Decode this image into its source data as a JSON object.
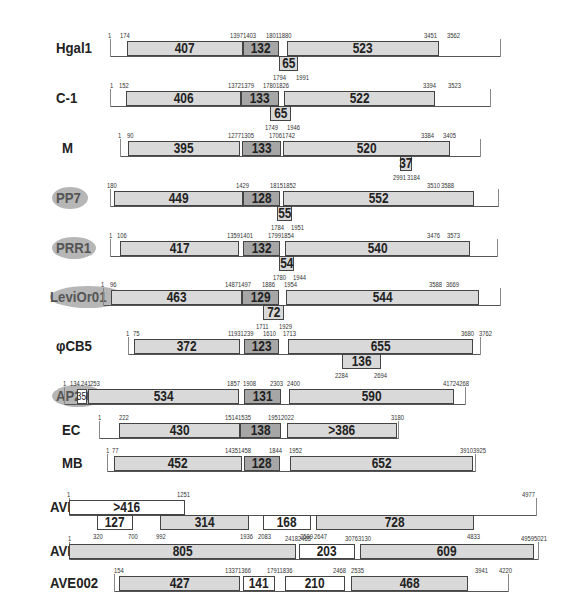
{
  "diagram": {
    "type": "genome-organization",
    "rows": [
      {
        "name": "Hgal1",
        "oval": false,
        "y": 48,
        "baseline": [
          110,
          500
        ],
        "coords_top": [
          {
            "t": "1",
            "x": 108
          },
          {
            "t": "174",
            "x": 120
          },
          {
            "t": "13971403",
            "x": 230
          },
          {
            "t": "18011880",
            "x": 266
          },
          {
            "t": "3451",
            "x": 424
          },
          {
            "t": "3562",
            "x": 447
          }
        ],
        "boxes": [
          {
            "v": "407",
            "x": 127,
            "w": 116,
            "cls": "light"
          },
          {
            "v": "132",
            "x": 243,
            "w": 36,
            "cls": "dark"
          },
          {
            "v": "523",
            "x": 287,
            "w": 152,
            "cls": "light"
          }
        ],
        "lower": [
          {
            "v": "65",
            "x": 279,
            "w": 19,
            "cls": "light"
          }
        ],
        "coords_bottom": [
          {
            "t": "1794",
            "x": 273
          },
          {
            "t": "1991",
            "x": 296
          }
        ]
      },
      {
        "name": "C-1",
        "oval": false,
        "y": 98,
        "baseline": [
          110,
          490
        ],
        "coords_top": [
          {
            "t": "1",
            "x": 110
          },
          {
            "t": "152",
            "x": 119
          },
          {
            "t": "13721379",
            "x": 228
          },
          {
            "t": "17801826",
            "x": 263
          },
          {
            "t": "3394",
            "x": 423
          },
          {
            "t": "3523",
            "x": 448
          }
        ],
        "boxes": [
          {
            "v": "406",
            "x": 126,
            "w": 115,
            "cls": "light"
          },
          {
            "v": "133",
            "x": 241,
            "w": 38,
            "cls": "dark"
          },
          {
            "v": "522",
            "x": 284,
            "w": 151,
            "cls": "light"
          }
        ],
        "lower": [
          {
            "v": "65",
            "x": 270,
            "w": 21,
            "cls": "light"
          }
        ],
        "coords_bottom": [
          {
            "t": "1749",
            "x": 265
          },
          {
            "t": "1946",
            "x": 287
          }
        ]
      },
      {
        "name": "M",
        "oval": false,
        "y": 148,
        "baseline": [
          120,
          480
        ],
        "coords_top": [
          {
            "t": "1",
            "x": 118
          },
          {
            "t": "90",
            "x": 127
          },
          {
            "t": "12771305",
            "x": 228
          },
          {
            "t": "17061742",
            "x": 269
          },
          {
            "t": "3384",
            "x": 421
          },
          {
            "t": "3405",
            "x": 443
          }
        ],
        "boxes": [
          {
            "v": "395",
            "x": 128,
            "w": 112,
            "cls": "light"
          },
          {
            "v": "133",
            "x": 242,
            "w": 39,
            "cls": "dark"
          },
          {
            "v": "520",
            "x": 283,
            "w": 167,
            "cls": "light"
          }
        ],
        "lower": [
          {
            "v": "37",
            "x": 400,
            "w": 12,
            "cls": "light"
          }
        ],
        "coords_bottom": [
          {
            "t": "2991",
            "x": 393
          },
          {
            "t": "3184",
            "x": 407
          }
        ]
      },
      {
        "name": "PP7",
        "oval": true,
        "y": 198,
        "baseline": [
          110,
          498
        ],
        "coords_top": [
          {
            "t": "180",
            "x": 107
          },
          {
            "t": "1429",
            "x": 236
          },
          {
            "t": "18151852",
            "x": 270
          },
          {
            "t": "3510",
            "x": 427
          },
          {
            "t": "3588",
            "x": 441
          }
        ],
        "boxes": [
          {
            "v": "449",
            "x": 114,
            "w": 129,
            "cls": "light"
          },
          {
            "v": "128",
            "x": 243,
            "w": 37,
            "cls": "dark"
          },
          {
            "v": "552",
            "x": 283,
            "w": 191,
            "cls": "light"
          }
        ],
        "lower": [
          {
            "v": "55",
            "x": 277,
            "w": 15,
            "cls": "light"
          }
        ],
        "coords_bottom": [
          {
            "t": "1784",
            "x": 271
          },
          {
            "t": "1951",
            "x": 291
          }
        ]
      },
      {
        "name": "PRR1",
        "oval": true,
        "y": 248,
        "baseline": [
          110,
          497
        ],
        "coords_top": [
          {
            "t": "1",
            "x": 109
          },
          {
            "t": "106",
            "x": 117
          },
          {
            "t": "13591401",
            "x": 227
          },
          {
            "t": "17991854",
            "x": 268
          },
          {
            "t": "3476",
            "x": 427
          },
          {
            "t": "3573",
            "x": 447
          }
        ],
        "boxes": [
          {
            "v": "417",
            "x": 120,
            "w": 119,
            "cls": "light"
          },
          {
            "v": "132",
            "x": 243,
            "w": 37,
            "cls": "dark"
          },
          {
            "v": "540",
            "x": 285,
            "w": 185,
            "cls": "light"
          }
        ],
        "lower": [
          {
            "v": "54",
            "x": 279,
            "w": 15,
            "cls": "light"
          }
        ],
        "coords_bottom": [
          {
            "t": "1780",
            "x": 273
          },
          {
            "t": "1944",
            "x": 293
          }
        ]
      },
      {
        "name": "LeviOr01",
        "oval": true,
        "y": 297,
        "baseline": [
          103,
          500
        ],
        "coords_top": [
          {
            "t": "1",
            "x": 101
          },
          {
            "t": "96",
            "x": 110
          },
          {
            "t": "14871497",
            "x": 225
          },
          {
            "t": "1886",
            "x": 262
          },
          {
            "t": "1954",
            "x": 284
          },
          {
            "t": "3588",
            "x": 429
          },
          {
            "t": "3669",
            "x": 446
          }
        ],
        "boxes": [
          {
            "v": "463",
            "x": 111,
            "w": 131,
            "cls": "light"
          },
          {
            "v": "129",
            "x": 242,
            "w": 37,
            "cls": "dark"
          },
          {
            "v": "544",
            "x": 286,
            "w": 193,
            "cls": "light"
          }
        ],
        "lower": [
          {
            "v": "72",
            "x": 263,
            "w": 21,
            "cls": "light"
          }
        ],
        "coords_bottom": [
          {
            "t": "1711",
            "x": 256
          },
          {
            "t": "1929",
            "x": 279
          }
        ]
      },
      {
        "name": "φCB5",
        "oval": false,
        "y": 346,
        "baseline": [
          128,
          480
        ],
        "coords_top": [
          {
            "t": "1",
            "x": 126
          },
          {
            "t": "75",
            "x": 133
          },
          {
            "t": "11931239",
            "x": 228
          },
          {
            "t": "1610",
            "x": 263
          },
          {
            "t": "1713",
            "x": 283
          },
          {
            "t": "3680",
            "x": 461
          },
          {
            "t": "3762",
            "x": 479
          }
        ],
        "boxes": [
          {
            "v": "372",
            "x": 134,
            "w": 106,
            "cls": "light"
          },
          {
            "v": "123",
            "x": 244,
            "w": 35,
            "cls": "dark"
          },
          {
            "v": "655",
            "x": 288,
            "w": 185,
            "cls": "light"
          }
        ],
        "lower": [
          {
            "v": "136",
            "x": 342,
            "w": 39,
            "cls": "light"
          }
        ],
        "coords_bottom": [
          {
            "t": "2284",
            "x": 335
          },
          {
            "t": "2694",
            "x": 374
          }
        ]
      },
      {
        "name": "AP205",
        "oval": true,
        "y": 396,
        "baseline": [
          64,
          465
        ],
        "coords_top": [
          {
            "t": "1",
            "x": 63
          },
          {
            "t": "134",
            "x": 70
          },
          {
            "t": "241",
            "x": 81
          },
          {
            "t": "253",
            "x": 90
          },
          {
            "t": "1857",
            "x": 227
          },
          {
            "t": "1908",
            "x": 243
          },
          {
            "t": "2303",
            "x": 270
          },
          {
            "t": "2400",
            "x": 287
          },
          {
            "t": "4172",
            "x": 443
          },
          {
            "t": "4268",
            "x": 456
          }
        ],
        "boxes": [
          {
            "v": "35",
            "x": 77,
            "w": 10,
            "cls": "white small"
          },
          {
            "v": "534",
            "x": 88,
            "w": 151,
            "cls": "light"
          },
          {
            "v": "131",
            "x": 244,
            "w": 37,
            "cls": "dark"
          },
          {
            "v": "590",
            "x": 289,
            "w": 165,
            "cls": "light"
          }
        ],
        "lower": [],
        "coords_bottom": []
      },
      {
        "name": "EC",
        "oval": false,
        "y": 430,
        "baseline": [
          99,
          398
        ],
        "coords_top": [
          {
            "t": "1",
            "x": 98
          },
          {
            "t": "222",
            "x": 119
          },
          {
            "t": "15141535",
            "x": 225
          },
          {
            "t": "19512022",
            "x": 268
          },
          {
            "t": "3180",
            "x": 391
          }
        ],
        "boxes": [
          {
            "v": "430",
            "x": 119,
            "w": 121,
            "cls": "light"
          },
          {
            "v": "138",
            "x": 240,
            "w": 41,
            "cls": "dark"
          },
          {
            "v": "&gt;386",
            "x": 287,
            "w": 110,
            "cls": "light"
          }
        ],
        "lower": [],
        "coords_bottom": []
      },
      {
        "name": "MB",
        "oval": false,
        "y": 463,
        "baseline": [
          107,
          475
        ],
        "coords_top": [
          {
            "t": "1",
            "x": 106
          },
          {
            "t": "77",
            "x": 112
          },
          {
            "t": "14351458",
            "x": 225
          },
          {
            "t": "1844",
            "x": 269
          },
          {
            "t": "1952",
            "x": 289
          },
          {
            "t": "39103925",
            "x": 460
          }
        ],
        "boxes": [
          {
            "v": "452",
            "x": 114,
            "w": 128,
            "cls": "light"
          },
          {
            "v": "128",
            "x": 244,
            "w": 36,
            "cls": "dark"
          },
          {
            "v": "652",
            "x": 290,
            "w": 183,
            "cls": "light"
          }
        ],
        "lower": [],
        "coords_bottom": []
      },
      {
        "name": "AVE000",
        "oval": false,
        "y": 507,
        "baseline": [
          69,
          536
        ],
        "coords_top": [
          {
            "t": "1",
            "x": 67
          },
          {
            "t": "1251",
            "x": 177
          },
          {
            "t": "4977",
            "x": 522
          }
        ],
        "boxes": [
          {
            "v": "&gt;416",
            "x": 69,
            "w": 116,
            "cls": "white"
          }
        ],
        "lower": [
          {
            "v": "127",
            "x": 97,
            "w": 36,
            "cls": "white"
          },
          {
            "v": "314",
            "x": 160,
            "w": 89,
            "cls": "light"
          },
          {
            "v": "168",
            "x": 263,
            "w": 48,
            "cls": "white"
          },
          {
            "v": "728",
            "x": 316,
            "w": 158,
            "cls": "light"
          }
        ],
        "coords_bottom": [
          {
            "t": "320",
            "x": 93
          },
          {
            "t": "700",
            "x": 128
          },
          {
            "t": "992",
            "x": 156
          },
          {
            "t": "1936",
            "x": 240
          },
          {
            "t": "2083",
            "x": 258
          },
          {
            "t": "2589",
            "x": 300
          },
          {
            "t": "2647",
            "x": 314
          },
          {
            "t": "4833",
            "x": 467
          }
        ]
      },
      {
        "name": "AVE001",
        "oval": false,
        "y": 551,
        "baseline": [
          69,
          538
        ],
        "coords_top": [
          {
            "t": "1",
            "x": 68
          },
          {
            "t": "24182465",
            "x": 285
          },
          {
            "t": "30763130",
            "x": 345
          },
          {
            "t": "49595021",
            "x": 521
          }
        ],
        "boxes": [
          {
            "v": "805",
            "x": 69,
            "w": 227,
            "cls": "light"
          },
          {
            "v": "203",
            "x": 299,
            "w": 56,
            "cls": "white"
          },
          {
            "v": "609",
            "x": 360,
            "w": 174,
            "cls": "light"
          }
        ],
        "lower": [],
        "coords_bottom": []
      },
      {
        "name": "AVE002",
        "oval": false,
        "y": 583,
        "baseline": [
          114,
          508
        ],
        "coords_top": [
          {
            "t": "154",
            "x": 114
          },
          {
            "t": "13371366",
            "x": 225
          },
          {
            "t": "17911836",
            "x": 267
          },
          {
            "t": "2468",
            "x": 333
          },
          {
            "t": "2535",
            "x": 351
          },
          {
            "t": "3941",
            "x": 475
          },
          {
            "t": "4220",
            "x": 499
          }
        ],
        "boxes": [
          {
            "v": "427",
            "x": 119,
            "w": 121,
            "cls": "light"
          },
          {
            "v": "141",
            "x": 243,
            "w": 32,
            "cls": "white"
          },
          {
            "v": "210",
            "x": 285,
            "w": 60,
            "cls": "white"
          },
          {
            "v": "468",
            "x": 351,
            "w": 117,
            "cls": "light"
          }
        ],
        "lower": [],
        "coords_bottom": []
      }
    ]
  }
}
